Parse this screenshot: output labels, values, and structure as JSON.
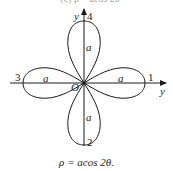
{
  "figure": {
    "top_caption_partial": "(c) ρ = acos 2θ",
    "caption": "ρ = acos 2θ.",
    "origin_label": "O",
    "axis_labels": {
      "vertical": "y",
      "horizontal": "y"
    },
    "petal_numbers": {
      "top": "4",
      "right": "1",
      "bottom": "2",
      "left": "3"
    },
    "petal_length_labels": {
      "top": "a",
      "right": "a",
      "bottom": "a",
      "left": "a"
    },
    "colors": {
      "stroke": "#1a1a1a",
      "background": "#ffffff"
    }
  }
}
